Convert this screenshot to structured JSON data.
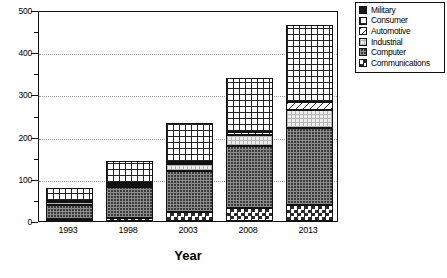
{
  "chart_data": {
    "type": "bar",
    "subtype": "stacked-bar",
    "title": "",
    "xlabel": "Year",
    "ylabel": "",
    "categories": [
      "1993",
      "1998",
      "2003",
      "2008",
      "2013"
    ],
    "ylim": [
      0,
      500
    ],
    "ytick_labels": [
      "0",
      "100",
      "200",
      "300",
      "400",
      "500"
    ],
    "ytick_values": [
      0,
      100,
      200,
      300,
      400,
      500
    ],
    "yminor_values": [
      50,
      150,
      250,
      350,
      450
    ],
    "gridlines": [
      100,
      200,
      300,
      400
    ],
    "grid": true,
    "legend_position": "top-right",
    "stack_order_bottom_to_top": [
      "Communications",
      "Computer",
      "Industrial",
      "Automotive",
      "Consumer"
    ],
    "series": [
      {
        "name": "Communications",
        "pattern": "checkerboard",
        "values": [
          4,
          6,
          22,
          30,
          38
        ]
      },
      {
        "name": "Computer",
        "pattern": "dense-dots",
        "values": [
          34,
          74,
          97,
          148,
          182
        ]
      },
      {
        "name": "Industrial",
        "pattern": "light-dots",
        "values": [
          6,
          6,
          16,
          26,
          42
        ]
      },
      {
        "name": "Automotive",
        "pattern": "diagonal",
        "values": [
          4,
          4,
          6,
          8,
          20
        ]
      },
      {
        "name": "Consumer",
        "pattern": "grid",
        "values": [
          30,
          53,
          92,
          128,
          183
        ]
      },
      {
        "name": "Military",
        "pattern": "solid-black",
        "values": [
          0,
          0,
          0,
          0,
          0
        ]
      }
    ],
    "totals": [
      78,
      143,
      233,
      340,
      465
    ]
  },
  "legend": {
    "items": [
      {
        "label": "Military",
        "swatch": "solid-black"
      },
      {
        "label": "Consumer",
        "swatch": "grid"
      },
      {
        "label": "Automotive",
        "swatch": "diagonal"
      },
      {
        "label": "Industrial",
        "swatch": "light-dots"
      },
      {
        "label": "Computer",
        "swatch": "dense-dots"
      },
      {
        "label": "Communications",
        "swatch": "checkerboard"
      }
    ]
  },
  "axis": {
    "x_title": "Year"
  },
  "colors": {
    "axis": "#111111",
    "grid": "#9a9a9a",
    "background": "#ffffff",
    "military": "#1a1a1a",
    "computer": "#3a3a3a",
    "industrial": "#ededed"
  }
}
